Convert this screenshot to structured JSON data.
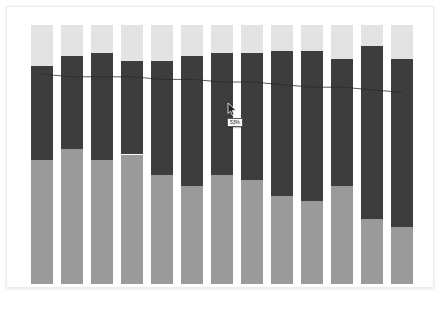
{
  "chart_data": {
    "type": "bar",
    "subtype": "stacked-bar-100",
    "title": "",
    "subtitle": "",
    "xlabel": "",
    "ylabel": "",
    "ylim": [
      0,
      100
    ],
    "grid": false,
    "legend": "none",
    "axis_ticks_visible": false,
    "categories": [
      "1",
      "2",
      "3",
      "4",
      "5",
      "6",
      "7",
      "8",
      "9",
      "10",
      "11",
      "12",
      "13"
    ],
    "series": [
      {
        "name": "bottom",
        "color": "#9a9a9a",
        "values": [
          48,
          52,
          48,
          50,
          42,
          38,
          42,
          40,
          34,
          32,
          38,
          25,
          22
        ]
      },
      {
        "name": "middle",
        "color": "#3d3d3d",
        "values": [
          36,
          36,
          41,
          36,
          44,
          50,
          47,
          49,
          56,
          58,
          49,
          67,
          65
        ]
      },
      {
        "name": "top",
        "color": "#e3e3e3",
        "values": [
          16,
          12,
          11,
          14,
          14,
          12,
          11,
          11,
          10,
          10,
          13,
          8,
          13
        ]
      }
    ],
    "overlay_line": {
      "name": "trend",
      "color": "#2a2a2a",
      "values": [
        81,
        80,
        80,
        80,
        79,
        79,
        78,
        78,
        77,
        76,
        76,
        75,
        74
      ]
    }
  },
  "card": {
    "background": "#ffffff",
    "border_color": "#ececec"
  },
  "tooltip": {
    "value": "53%",
    "visible": true
  },
  "cursor": {
    "type": "arrow-pointer",
    "x": 226,
    "y": 101
  },
  "colors": {
    "page_background": "#ffffff",
    "segment_top": "#e3e3e3",
    "segment_middle": "#3d3d3d",
    "segment_bottom": "#9a9a9a",
    "trend_line": "#2a2a2a"
  }
}
